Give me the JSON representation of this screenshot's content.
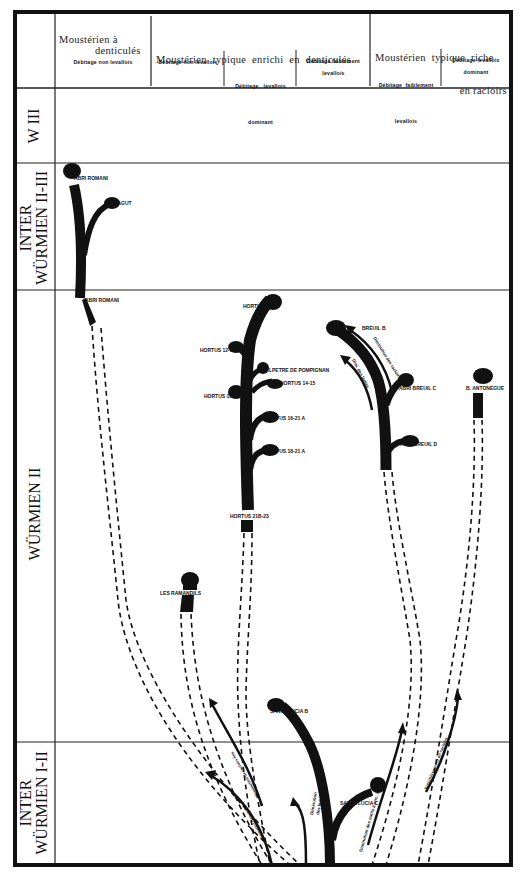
{
  "header": {
    "groups": [
      {
        "title_line1": "Moustérien à",
        "title_line2": "denticulés"
      },
      {
        "title_line1": "Moustérien  typique  enrichi  en  denticulés",
        "title_line2": ""
      },
      {
        "title_line1": "Moustérien  typique  riche",
        "title_line2": "en racloirs"
      }
    ],
    "subcolumns": [
      {
        "line1": "Débitage non levallois",
        "line2": ""
      },
      {
        "line1": "Débitage non levallois",
        "line2": ""
      },
      {
        "line1": "Débitage   levallois",
        "line2": "dominant"
      },
      {
        "line1": "Débitage faiblement",
        "line2": "levallois"
      },
      {
        "line1": "Débitage  faiblement",
        "line2": "levallois"
      },
      {
        "line1": "Débitage levallois",
        "line2": "dominant"
      }
    ]
  },
  "periods": [
    {
      "line1": "W III",
      "line2": ""
    },
    {
      "line1": "INTER",
      "line2": "WÜRMIEN II-III"
    },
    {
      "line1": "WÜRMIEN II",
      "line2": ""
    },
    {
      "line1": "INTER",
      "line2": "WÜRMIEN I-II"
    }
  ],
  "sites": {
    "abri_romani_top": "ABRI ROMANI",
    "abri_agut": "ABRI  AGUT",
    "abri_romani_base": "ABRI ROMANI",
    "hortus_7_11": "HORTUS 7-11",
    "hortus_12_17": "HORTUS  12-17",
    "salpetre": "SALPETRE DE POMPIGNAN",
    "hortus_14_15": "HORTUS  14-15",
    "hortus_15_17": "HORTUS 15-17",
    "hortus_16_21a": "HORTUS 16-21 A",
    "hortus_18_21a": "HORTUS 18-21 A",
    "hortus_21b_23": "HORTUS 21B-23",
    "abri_breuil_b_1": "ABRI",
    "abri_breuil_b_2": "BREUIL B",
    "abri_breuil_c": "ABRI  BREUIL C",
    "abri_breuil_d": "ABRI  BREUIL  D",
    "b_antonegue": "B. ANTONEGUE",
    "les_ramandils": "LES  RAMANDILS",
    "santa_lucia_b": "SANTA  LUCIA B",
    "santa_lucia_c": "SANTA  LUCIA C"
  },
  "annotations": {
    "dim_racloirs": "Diminution des racloirs",
    "dim_lames_breuil": "Dim. des lames",
    "dim_racloirs_lower": "Diminution des racloirs",
    "dim_racloirs_fins": "Diminution de racloirs fins",
    "dim_lames_lower_1": "Diminution",
    "dim_lames_lower_2": "des lames",
    "dim_outils": "Diminution des outils à enc. clact.",
    "enrichissement": "Enrichissement en racloirs"
  },
  "colors": {
    "ink": "#111111",
    "paper": "#ffffff",
    "rule": "#222222"
  }
}
